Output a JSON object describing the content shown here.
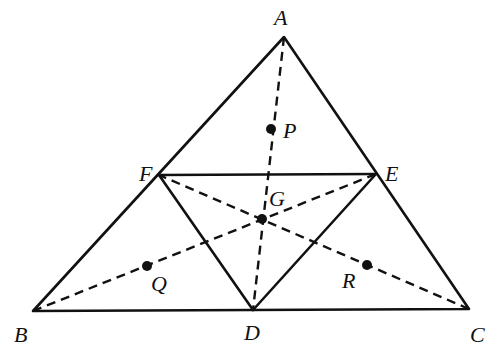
{
  "diagram": {
    "type": "geometry-triangle-medians",
    "vertices": {
      "A": {
        "label": "A",
        "x": 284,
        "y": 37
      },
      "B": {
        "label": "B",
        "x": 33,
        "y": 311
      },
      "C": {
        "label": "C",
        "x": 469,
        "y": 309
      },
      "D": {
        "label": "D",
        "x": 253,
        "y": 310
      },
      "E": {
        "label": "E",
        "x": 376,
        "y": 174
      },
      "F": {
        "label": "F",
        "x": 159,
        "y": 175
      },
      "G": {
        "label": "G",
        "x": 262,
        "y": 219
      }
    },
    "marked_points": {
      "P": {
        "label": "P",
        "x": 271,
        "y": 129
      },
      "Q": {
        "label": "Q",
        "x": 147,
        "y": 266
      },
      "R": {
        "label": "R",
        "x": 367,
        "y": 265
      }
    },
    "solid_segments": [
      "AB",
      "BC",
      "CA",
      "FE",
      "FD",
      "ED"
    ],
    "dashed_segments": [
      "AD",
      "BE",
      "CF"
    ],
    "labels": {
      "A": "A",
      "B": "B",
      "C": "C",
      "D": "D",
      "E": "E",
      "F": "F",
      "G": "G",
      "P": "P",
      "Q": "Q",
      "R": "R"
    }
  }
}
